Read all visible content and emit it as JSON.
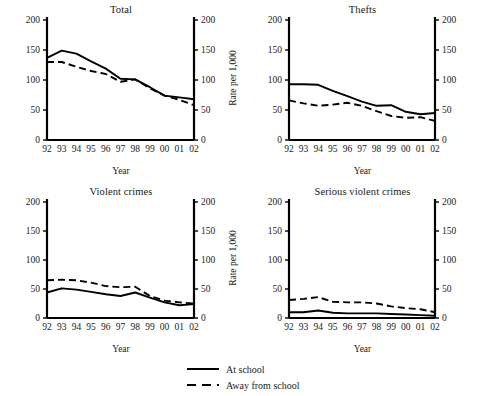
{
  "figure": {
    "legend": {
      "items": [
        {
          "label": "At school",
          "style": "solid"
        },
        {
          "label": "Away from school",
          "style": "dashed"
        }
      ]
    }
  },
  "chart_data": [
    {
      "type": "line",
      "title": "Total",
      "xlabel": "Year",
      "ylabel": "Rate per 1,000",
      "x": [
        "92",
        "93",
        "94",
        "95",
        "96",
        "97",
        "98",
        "99",
        "00",
        "01",
        "02"
      ],
      "ylim": [
        0,
        200
      ],
      "yticks": [
        0,
        50,
        100,
        150,
        200
      ],
      "right_axis": true,
      "grid": false,
      "legend_position": "below figure",
      "series": [
        {
          "name": "At school",
          "style": "solid",
          "values": [
            137,
            149,
            144,
            131,
            119,
            102,
            101,
            88,
            74,
            71,
            68
          ]
        },
        {
          "name": "Away from school",
          "style": "dashed",
          "values": [
            130,
            130,
            122,
            115,
            110,
            97,
            101,
            86,
            74,
            67,
            58
          ]
        }
      ]
    },
    {
      "type": "line",
      "title": "Thefts",
      "xlabel": "Year",
      "ylabel": "Rate per 1,000",
      "x": [
        "92",
        "93",
        "94",
        "95",
        "96",
        "97",
        "98",
        "99",
        "00",
        "01",
        "02"
      ],
      "ylim": [
        0,
        200
      ],
      "yticks": [
        0,
        50,
        100,
        150,
        200
      ],
      "right_axis": true,
      "grid": false,
      "legend_position": "below figure",
      "series": [
        {
          "name": "At school",
          "style": "solid",
          "values": [
            93,
            93,
            92,
            82,
            73,
            64,
            57,
            58,
            47,
            43,
            45
          ]
        },
        {
          "name": "Away from school",
          "style": "dashed",
          "values": [
            66,
            61,
            57,
            59,
            62,
            57,
            48,
            40,
            37,
            38,
            32
          ]
        }
      ]
    },
    {
      "type": "line",
      "title": "Violent crimes",
      "xlabel": "Year",
      "ylabel": "Rate per 1,000",
      "x": [
        "92",
        "93",
        "94",
        "95",
        "96",
        "97",
        "98",
        "99",
        "00",
        "01",
        "02"
      ],
      "ylim": [
        0,
        200
      ],
      "yticks": [
        0,
        50,
        100,
        150,
        200
      ],
      "right_axis": true,
      "grid": false,
      "legend_position": "below figure",
      "series": [
        {
          "name": "At school",
          "style": "solid",
          "values": [
            44,
            51,
            49,
            45,
            41,
            38,
            44,
            35,
            27,
            22,
            24
          ]
        },
        {
          "name": "Away from school",
          "style": "dashed",
          "values": [
            65,
            66,
            65,
            61,
            55,
            53,
            54,
            38,
            30,
            27,
            25
          ]
        }
      ]
    },
    {
      "type": "line",
      "title": "Serious violent crimes",
      "xlabel": "Year",
      "ylabel": "Rate per 1,000",
      "x": [
        "92",
        "93",
        "94",
        "95",
        "96",
        "97",
        "98",
        "99",
        "00",
        "01",
        "02"
      ],
      "ylim": [
        0,
        200
      ],
      "yticks": [
        0,
        50,
        100,
        150,
        200
      ],
      "right_axis": true,
      "grid": false,
      "legend_position": "below figure",
      "series": [
        {
          "name": "At school",
          "style": "solid",
          "values": [
            10,
            10,
            13,
            9,
            8,
            8,
            8,
            7,
            6,
            5,
            4
          ]
        },
        {
          "name": "Away from school",
          "style": "dashed",
          "values": [
            31,
            33,
            36,
            28,
            27,
            27,
            25,
            20,
            17,
            15,
            10
          ]
        }
      ]
    }
  ]
}
